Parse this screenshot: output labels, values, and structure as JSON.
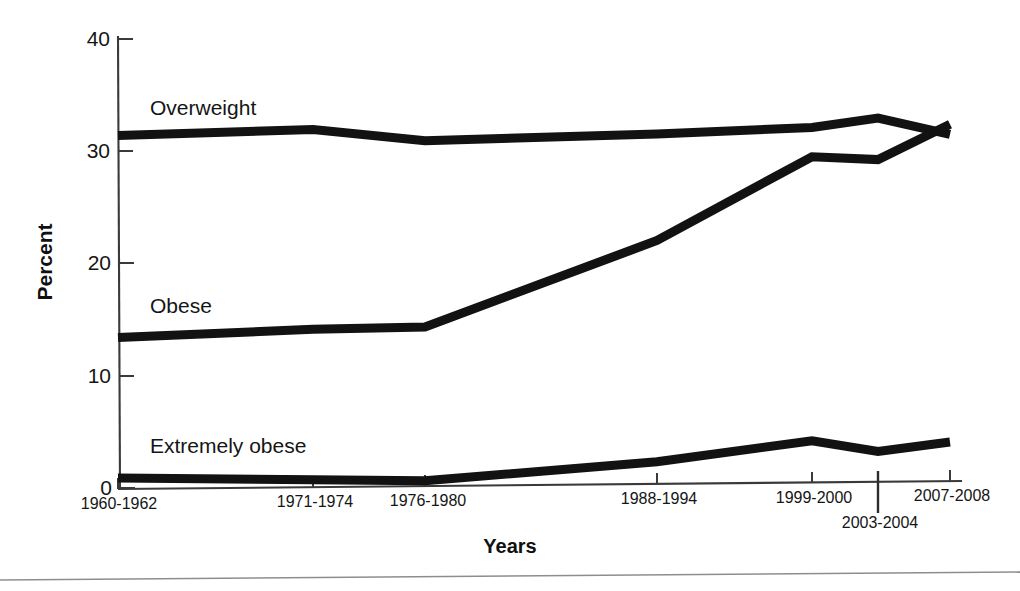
{
  "chart_data": {
    "type": "line",
    "title": "",
    "xlabel": "Years",
    "ylabel": "Percent",
    "ylim": [
      0,
      40
    ],
    "yticks": [
      0,
      10,
      20,
      30,
      40
    ],
    "ytick_labels": [
      "0",
      "10",
      "20",
      "30",
      "40"
    ],
    "grid": false,
    "legend": "inline-labels",
    "categories": [
      "1960-1962",
      "1971-1974",
      "1976-1980",
      "1988-1994",
      "1999-2000",
      "2003-2004",
      "2007-2008"
    ],
    "series": [
      {
        "name": "Overweight",
        "values": [
          31.4,
          32.1,
          31.2,
          32.0,
          32.7,
          33.6,
          32.2
        ]
      },
      {
        "name": "Obese",
        "values": [
          13.4,
          14.3,
          14.6,
          22.5,
          30.1,
          29.9,
          33.1
        ]
      },
      {
        "name": "Extremely obese",
        "values": [
          0.9,
          0.9,
          0.9,
          2.8,
          4.8,
          3.9,
          4.8
        ]
      }
    ],
    "series_label_positions": [
      {
        "name": "Overweight",
        "x": 1,
        "y": 35.5
      },
      {
        "name": "Obese",
        "x": 1,
        "y": 18.0
      },
      {
        "name": "Extremely obese",
        "x": 1,
        "y": 5.9
      }
    ],
    "annotations": [
      {
        "text": "2003-2004",
        "note": "x tick label offset below axis on a longer tick"
      }
    ],
    "colors": {
      "line": "#121212",
      "axis": "#3a3a3a",
      "text": "#151515",
      "background": "#ffffff"
    }
  }
}
